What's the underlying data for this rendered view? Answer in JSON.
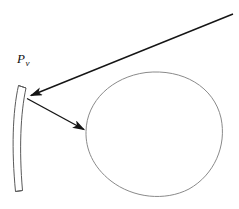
{
  "figure": {
    "background_color": "#ffffff",
    "width": 239,
    "height": 209,
    "labels": [
      {
        "id": "mirror-label",
        "base": "P",
        "subscript": "v",
        "x": 17,
        "y": 52,
        "color": "#111111",
        "style": "italic"
      }
    ],
    "shapes": {
      "mirror": {
        "name": "curved-mirror",
        "description": "thin crescent shaped curved mirror, concave toward the right",
        "stroke_color": "#555555",
        "fill_color": "none",
        "stroke_width": 1,
        "top_y": 85,
        "bottom_y": 192,
        "vertex_x": 26,
        "vertex_y": 97
      },
      "circle": {
        "name": "circular-object",
        "description": "large slightly irregular hand drawn circle",
        "stroke_color": "#8a8a8a",
        "fill_color": "none",
        "stroke_width": 1,
        "left_x": 85,
        "right_x": 223,
        "top_y": 72,
        "bottom_y": 196,
        "center_x": 154,
        "center_y": 134
      }
    },
    "rays": [
      {
        "id": "incoming-ray",
        "name": "long-incoming-ray",
        "from_x": 233,
        "from_y": 14,
        "to_x": 28,
        "to_y": 96,
        "arrowhead_at": "end",
        "color": "#151515",
        "stroke_width": 1.4
      },
      {
        "id": "reflected-ray",
        "name": "reflected-ray-to-object",
        "from_x": 27,
        "from_y": 99,
        "to_x": 87,
        "to_y": 131,
        "arrowhead_at": "end",
        "color": "#151515",
        "stroke_width": 1.4
      }
    ]
  }
}
